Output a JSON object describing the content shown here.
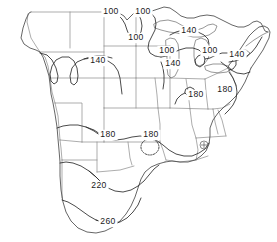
{
  "figure": {
    "kind": "contour-map",
    "region": "continental-united-states",
    "background_color": "#ffffff",
    "line_color": "#2b2b2b",
    "boundary_color": "#8a8a8a"
  },
  "chart_data": {
    "type": "contour",
    "title": "",
    "xlabel": "",
    "ylabel": "",
    "grid": false,
    "legend": "none",
    "contour_levels": [
      100,
      140,
      180,
      220,
      260
    ],
    "level_interval": 40,
    "value_range": [
      100,
      260
    ],
    "labels": [
      {
        "id": "lbl-100-a",
        "text": "100",
        "x": 111,
        "y": 12,
        "level": 100,
        "region": "north-central"
      },
      {
        "id": "lbl-100-b",
        "text": "100",
        "x": 143,
        "y": 12,
        "level": 100,
        "region": "north-central"
      },
      {
        "id": "lbl-100-c",
        "text": "100",
        "x": 136,
        "y": 38,
        "level": 100,
        "region": "upper-midwest"
      },
      {
        "id": "lbl-140-a",
        "text": "140",
        "x": 98,
        "y": 61,
        "level": 140,
        "region": "west-central"
      },
      {
        "id": "lbl-140-b",
        "text": "140",
        "x": 189,
        "y": 31,
        "level": 140,
        "region": "lake-superior"
      },
      {
        "id": "lbl-100-d",
        "text": "100",
        "x": 167,
        "y": 51,
        "level": 100,
        "region": "lake-michigan-west"
      },
      {
        "id": "lbl-140-c",
        "text": "140",
        "x": 173,
        "y": 64,
        "level": 140,
        "region": "illinois"
      },
      {
        "id": "lbl-100-e",
        "text": "100",
        "x": 210,
        "y": 51,
        "level": 100,
        "region": "lake-erie"
      },
      {
        "id": "lbl-140-d",
        "text": "140",
        "x": 237,
        "y": 55,
        "level": 140,
        "region": "northeast"
      },
      {
        "id": "lbl-180-a",
        "text": "180",
        "x": 196,
        "y": 95,
        "level": 180,
        "region": "ohio-valley"
      },
      {
        "id": "lbl-180-b",
        "text": "180",
        "x": 225,
        "y": 90,
        "level": 180,
        "region": "mid-atlantic"
      },
      {
        "id": "lbl-180-c",
        "text": "180",
        "x": 108,
        "y": 135,
        "level": 180,
        "region": "southern-plains"
      },
      {
        "id": "lbl-180-d",
        "text": "180",
        "x": 151,
        "y": 135,
        "level": 180,
        "region": "arkansas"
      },
      {
        "id": "lbl-220-a",
        "text": "220",
        "x": 99,
        "y": 186,
        "level": 220,
        "region": "texas"
      },
      {
        "id": "lbl-260-a",
        "text": "260",
        "x": 108,
        "y": 222,
        "level": 260,
        "region": "south-texas"
      }
    ],
    "closed_contours": [
      {
        "id": "closed-180-arkansas",
        "level": 180,
        "style": "dashed",
        "cx": 150,
        "cy": 147,
        "rx": 9,
        "ry": 8,
        "note": "small closed maximum"
      },
      {
        "id": "closed-180-ohio",
        "level": 180,
        "style": "solid",
        "cx": 189,
        "cy": 92,
        "rx": 5,
        "ry": 4,
        "note": "small closed maximum"
      }
    ],
    "station_markers": [
      {
        "id": "station-southeast",
        "symbol": "circle-cross",
        "x": 204,
        "y": 145
      }
    ]
  }
}
